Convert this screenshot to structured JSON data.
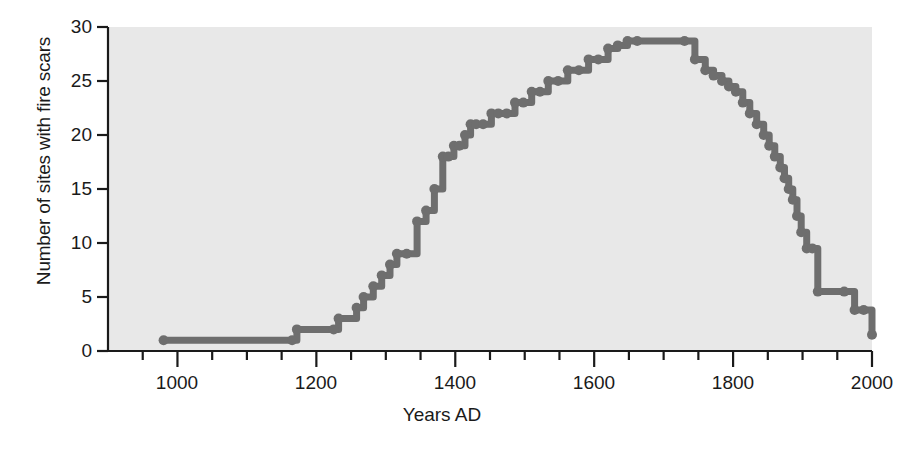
{
  "chart_data": {
    "type": "line",
    "step": "post",
    "title": "",
    "xlabel": "Years AD",
    "ylabel": "Number of sites with fire scars",
    "xlim": [
      900,
      2000
    ],
    "ylim": [
      0,
      30
    ],
    "grid": false,
    "legend": null,
    "xticks": [
      1000,
      1200,
      1400,
      1600,
      1800,
      2000
    ],
    "xtick_labels": [
      "1000",
      "1200",
      "1400",
      "1600",
      "1800",
      "2000"
    ],
    "xminor_step": 50,
    "yticks": [
      0,
      5,
      10,
      15,
      20,
      25,
      30
    ],
    "ytick_labels": [
      "0",
      "5",
      "10",
      "15",
      "20",
      "25",
      "30"
    ],
    "plot_bg_color": "#e8e8e8",
    "line_color": "#6e6e6e",
    "marker": "circle",
    "marker_size": 7,
    "line_width": 7,
    "x": [
      980,
      1165,
      1172,
      1225,
      1232,
      1258,
      1268,
      1282,
      1294,
      1306,
      1316,
      1330,
      1345,
      1358,
      1370,
      1382,
      1390,
      1398,
      1406,
      1414,
      1422,
      1430,
      1440,
      1452,
      1462,
      1474,
      1486,
      1498,
      1510,
      1522,
      1534,
      1548,
      1562,
      1578,
      1592,
      1606,
      1620,
      1634,
      1648,
      1662,
      1730,
      1745,
      1760,
      1772,
      1784,
      1794,
      1804,
      1814,
      1824,
      1834,
      1844,
      1852,
      1860,
      1868,
      1874,
      1880,
      1886,
      1892,
      1898,
      1906,
      1914,
      1922,
      1960,
      1975,
      1988,
      2000
    ],
    "y": [
      1,
      1,
      2,
      2,
      3,
      4,
      5,
      6,
      7,
      8,
      9,
      9,
      12,
      13,
      15,
      18,
      18,
      19,
      19,
      20,
      21,
      21,
      21,
      22,
      22,
      22,
      23,
      23,
      24,
      24,
      25,
      25,
      26,
      26,
      27,
      27,
      28,
      28.3,
      28.7,
      28.7,
      28.7,
      27,
      26,
      25.5,
      25,
      24.5,
      24,
      23,
      22,
      21,
      20,
      19,
      18,
      17,
      16,
      15,
      14,
      12.5,
      11,
      9.5,
      9.5,
      5.5,
      5.5,
      3.8,
      3.8,
      1.5
    ]
  },
  "axes": {
    "x_axis_name": "Years AD",
    "y_axis_name": "Number of sites with fire scars"
  }
}
